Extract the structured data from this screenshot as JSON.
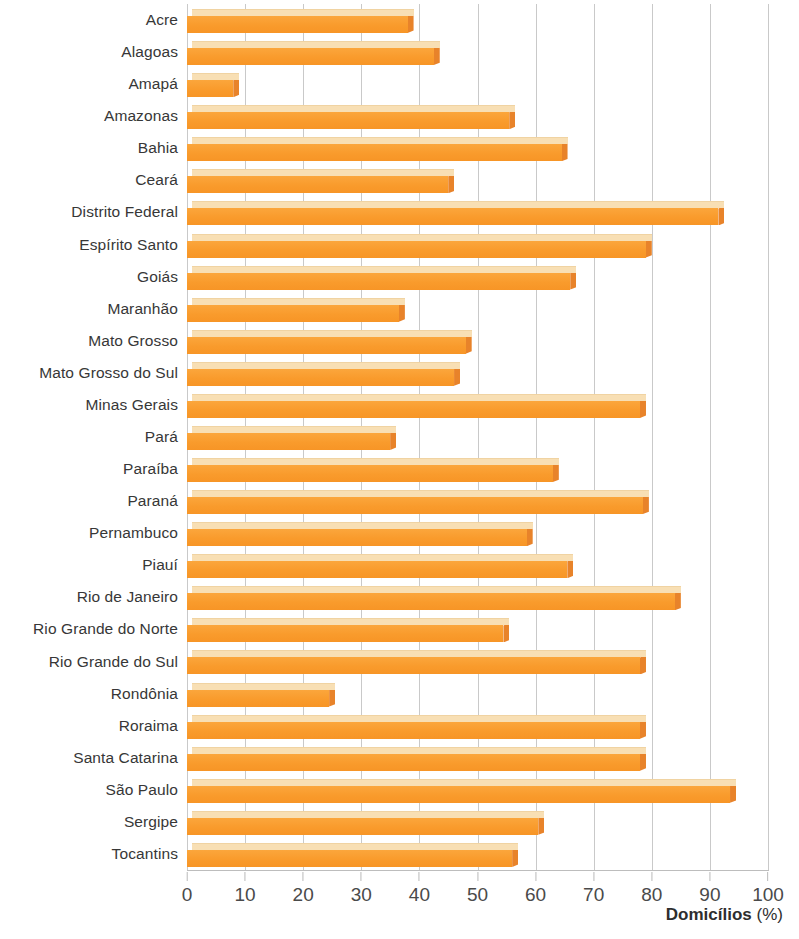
{
  "chart_data": {
    "type": "bar",
    "orientation": "horizontal",
    "title": "",
    "subtitle": "",
    "xlabel": "Domicílios (%)",
    "ylabel": "",
    "xlim": [
      0,
      100
    ],
    "xticks": [
      0,
      10,
      20,
      30,
      40,
      50,
      60,
      70,
      80,
      90,
      100
    ],
    "grid": true,
    "legend": null,
    "categories": [
      "Acre",
      "Alagoas",
      "Amapá",
      "Amazonas",
      "Bahia",
      "Ceará",
      "Distrito Federal",
      "Espírito Santo",
      "Goiás",
      "Maranhão",
      "Mato Grosso",
      "Mato Grosso do Sul",
      "Minas Gerais",
      "Pará",
      "Paraíba",
      "Paraná",
      "Pernambuco",
      "Piauí",
      "Rio de Janeiro",
      "Rio Grande do Norte",
      "Rio Grande do Sul",
      "Rondônia",
      "Roraima",
      "Santa Catarina",
      "São Paulo",
      "Sergipe",
      "Tocantins"
    ],
    "values": [
      39,
      43.5,
      9,
      56.5,
      65.5,
      46,
      92.5,
      80,
      67,
      37.5,
      49,
      47,
      79,
      36,
      64,
      79.5,
      59.5,
      66.5,
      85,
      55.5,
      79,
      25.5,
      79,
      79,
      94.5,
      61.5,
      57
    ],
    "series_color": "#f99b2c",
    "series_top_color": "#f8dfb4",
    "series_cap_color": "#e8832a",
    "grid_color": "#c9c9c9"
  }
}
